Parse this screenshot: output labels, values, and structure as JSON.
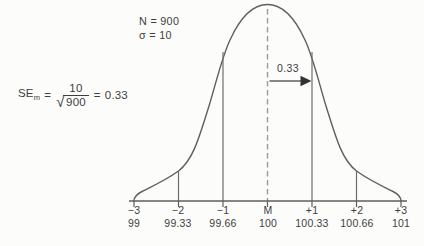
{
  "figure": {
    "params": {
      "n": "N = 900",
      "sigma": "σ = 10"
    },
    "formula": {
      "lhs": "SE",
      "lhs_sub": "m",
      "equals1": "=",
      "numerator": "10",
      "radical": "√",
      "radicand": "900",
      "equals2": "=",
      "result": "0.33"
    },
    "shift_arrow_label": "0.33",
    "axis": {
      "sigma_labels": [
        "−3",
        "−2",
        "−1",
        "M",
        "+1",
        "+2",
        "+3"
      ],
      "value_labels": [
        "99",
        "99.33",
        "99.66",
        "100",
        "100.33",
        "100.66",
        "101"
      ],
      "tick_positions_sigma": [
        -3,
        -2,
        -1,
        0,
        1,
        2,
        3
      ],
      "mean_value": 100,
      "standard_error": 0.33
    },
    "colors": {
      "stroke": "#5f5f5f",
      "dashed": "#9b9b9b",
      "text": "#3e3e3e",
      "background": "#fcfcfb"
    }
  }
}
